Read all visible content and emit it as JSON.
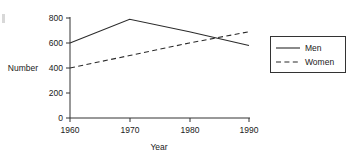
{
  "chart_data": {
    "type": "line",
    "title": "",
    "xlabel": "Year",
    "ylabel": "Number",
    "x": [
      1960,
      1970,
      1980,
      1990
    ],
    "xticklabels": [
      "1960",
      "1970",
      "1980",
      "1990"
    ],
    "yticks": [
      0,
      200,
      400,
      600,
      800
    ],
    "yticklabels": [
      "0",
      "200",
      "400",
      "600",
      "800"
    ],
    "ylim": [
      0,
      800
    ],
    "xlim": [
      1960,
      1990
    ],
    "grid": false,
    "legend_position": "right-outside",
    "series": [
      {
        "name": "Men",
        "style": "solid",
        "color": "#2b2b2b",
        "values": [
          600,
          790,
          690,
          580
        ]
      },
      {
        "name": "Women",
        "style": "dashed",
        "color": "#2b2b2b",
        "values": [
          400,
          500,
          600,
          690
        ]
      }
    ]
  },
  "axes": {
    "y_label": "Number",
    "x_label": "Year",
    "y_tick_0": "0",
    "y_tick_1": "200",
    "y_tick_2": "400",
    "y_tick_3": "600",
    "y_tick_4": "800",
    "x_tick_0": "1960",
    "x_tick_1": "1970",
    "x_tick_2": "1980",
    "x_tick_3": "1990"
  },
  "legend": {
    "entries": [
      {
        "label": "Men",
        "style": "solid"
      },
      {
        "label": "Women",
        "style": "dashed"
      }
    ],
    "entry_0_label": "Men",
    "entry_1_label": "Women"
  },
  "colors": {
    "background": "#ffffff",
    "ink": "#2b2b2b",
    "axis": "#333333"
  }
}
